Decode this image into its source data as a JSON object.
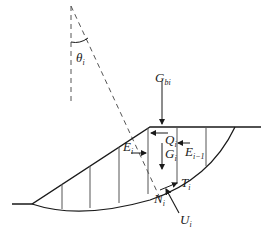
{
  "diagram": {
    "labels": {
      "theta": {
        "main": "θ",
        "sub": "i"
      },
      "G_b": {
        "main": "G",
        "sub": "bi"
      },
      "Q": {
        "main": "Q",
        "sub": "i"
      },
      "E_left": {
        "main": "E",
        "sub": "i"
      },
      "E_right": {
        "main": "E",
        "sub": "i−1"
      },
      "G": {
        "main": "G",
        "sub": "i"
      },
      "T": {
        "main": "T",
        "sub": "i"
      },
      "N": {
        "main": "N",
        "sub": "i"
      },
      "U": {
        "main": "U",
        "sub": "i"
      }
    },
    "colors": {
      "line": "#1a1a1a",
      "dashed": "#555555",
      "background": "#ffffff"
    }
  }
}
